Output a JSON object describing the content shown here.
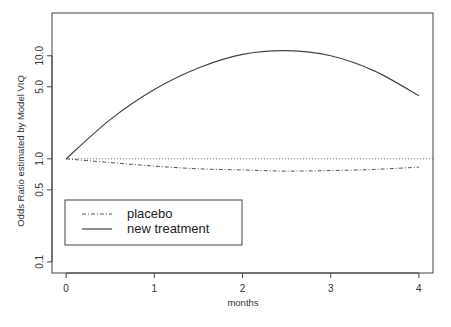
{
  "chart_data": {
    "type": "line",
    "title": "",
    "xlabel": "months",
    "ylabel": "Odds Ratio estimated by Model VIQ",
    "yscale": "log",
    "xlim": [
      -0.16,
      4.16
    ],
    "ylim": [
      0.078,
      26
    ],
    "x_ticks": [
      0,
      1,
      2,
      3,
      4
    ],
    "x_tick_labels": [
      "0",
      "1",
      "2",
      "3",
      "4"
    ],
    "y_ticks": [
      0.1,
      0.5,
      1.0,
      5.0,
      10.0
    ],
    "y_tick_labels": [
      "0.1",
      "0.5",
      "1.0",
      "5.0",
      "10.0"
    ],
    "grid": false,
    "reference_line": {
      "y": 1.0,
      "style": "dotted"
    },
    "legend_position": "bottom-left",
    "x": [
      0,
      0.5,
      1,
      1.5,
      2,
      2.5,
      3,
      3.5,
      4
    ],
    "series": [
      {
        "name": "placebo",
        "style": "dash-dot",
        "values": [
          1.0,
          0.92,
          0.85,
          0.8,
          0.78,
          0.76,
          0.77,
          0.79,
          0.83
        ]
      },
      {
        "name": "new treatment",
        "style": "solid",
        "values": [
          1.0,
          2.4,
          4.7,
          7.6,
          10.3,
          11.2,
          10.0,
          7.1,
          4.1
        ]
      }
    ],
    "legend": [
      "placebo",
      "new treatment"
    ]
  }
}
